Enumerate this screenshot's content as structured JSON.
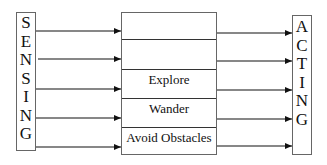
{
  "diagram": {
    "sensing": {
      "label": "SENSING",
      "letters": [
        "S",
        "E",
        "N",
        "S",
        "I",
        "N",
        "G"
      ]
    },
    "acting": {
      "label": "ACTING",
      "letters": [
        "A",
        "C",
        "T",
        "I",
        "N",
        "G"
      ]
    },
    "layers": [
      {
        "label": ""
      },
      {
        "label": ""
      },
      {
        "label": "Explore"
      },
      {
        "label": "Wander"
      },
      {
        "label": "Avoid Obstacles"
      }
    ],
    "colors": {
      "line": "#111111",
      "box_border": "#666666",
      "background": "#ffffff"
    }
  }
}
